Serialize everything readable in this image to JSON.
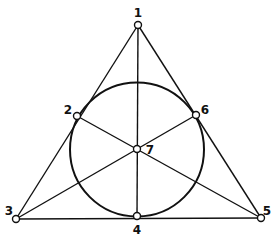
{
  "diagram": {
    "points": [
      {
        "id": "1",
        "x": 138,
        "y": 25,
        "label_x": 138,
        "label_y": 17
      },
      {
        "id": "2",
        "x": 77,
        "y": 116,
        "label_x": 68,
        "label_y": 114
      },
      {
        "id": "3",
        "x": 16,
        "y": 219,
        "label_x": 9,
        "label_y": 215
      },
      {
        "id": "4",
        "x": 137,
        "y": 216,
        "label_x": 137,
        "label_y": 234
      },
      {
        "id": "5",
        "x": 261,
        "y": 218,
        "label_x": 267,
        "label_y": 215
      },
      {
        "id": "6",
        "x": 196,
        "y": 115,
        "label_x": 205,
        "label_y": 114
      },
      {
        "id": "7",
        "x": 137,
        "y": 149,
        "label_x": 150,
        "label_y": 154
      }
    ],
    "lines": [
      [
        "1",
        "2",
        "3"
      ],
      [
        "1",
        "6",
        "5"
      ],
      [
        "3",
        "4",
        "5"
      ],
      [
        "1",
        "7",
        "4"
      ],
      [
        "3",
        "7",
        "6"
      ],
      [
        "5",
        "7",
        "2"
      ]
    ],
    "circle": {
      "through": [
        "2",
        "4",
        "6"
      ],
      "cx": 137,
      "cy": 149.5,
      "r": 67
    },
    "colors": {
      "stroke": "#111111",
      "background": "#ffffff"
    }
  }
}
